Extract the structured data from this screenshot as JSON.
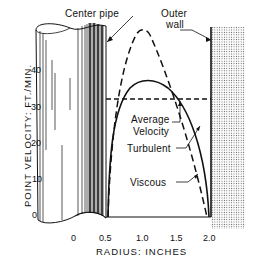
{
  "labels": {
    "center_pipe": "Center pipe",
    "outer_wall_line1": "Outer",
    "outer_wall_line2": "wall",
    "average_velocity_line1": "Average",
    "average_velocity_line2": "Velocity",
    "turbulent": "Turbulent",
    "viscous": "Viscous"
  },
  "axes": {
    "y_label": "POINT VELOCITY: FT./MIN.",
    "x_label": "RADIUS: INCHES",
    "y_ticks": [
      "0",
      "10",
      "20",
      "30",
      "40"
    ],
    "x_ticks": [
      "0",
      "0.5",
      "1.0",
      "1.5",
      "2.0"
    ]
  },
  "colors": {
    "ink": "#111111",
    "background": "#ffffff",
    "wall_dots": "#555555"
  }
}
